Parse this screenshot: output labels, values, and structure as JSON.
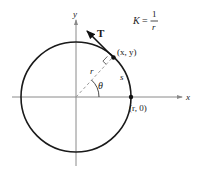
{
  "figure": {
    "formula": {
      "lhs": "K",
      "eq": "=",
      "numerator": "1",
      "denominator": "r"
    },
    "labels": {
      "x_axis": "x",
      "y_axis": "y",
      "tangent": "T",
      "point": "(x, y)",
      "intercept": "(r, 0)",
      "radius": "r",
      "arc": "s",
      "angle": "θ"
    },
    "colors": {
      "circle": "#1a1a1a",
      "axes": "#8a8a8a",
      "radius_dashed": "#9a9a9a",
      "text": "#1a1a1a"
    }
  }
}
